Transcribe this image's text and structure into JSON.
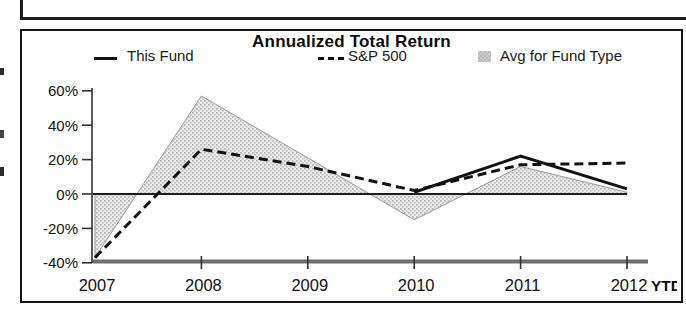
{
  "chart": {
    "title": "Annualized Total Return",
    "legend": {
      "this_fund_label": "This Fund",
      "sp500_label": "S&P 500",
      "avg_label": "Avg for Fund Type"
    }
  },
  "chart_data": {
    "type": "line",
    "title": "Annualized Total Return",
    "categories": [
      "2007",
      "2008",
      "2009",
      "2010",
      "2011",
      "2012"
    ],
    "x_axis_suffix": "YTD",
    "series": [
      {
        "name": "This Fund",
        "style": "solid-line",
        "values": [
          null,
          null,
          null,
          1,
          22,
          3
        ]
      },
      {
        "name": "S&P 500",
        "style": "dashed-line",
        "values": [
          -37,
          26,
          16,
          2,
          17,
          18
        ]
      },
      {
        "name": "Avg for Fund Type",
        "style": "shaded-area-to-zero",
        "values": [
          -37,
          57,
          21,
          -15,
          16,
          1
        ]
      }
    ],
    "yticks": [
      60,
      40,
      20,
      0,
      -20,
      -40
    ],
    "ytick_labels": [
      "60%",
      "40%",
      "20%",
      "0%",
      "-20%",
      "-40%"
    ],
    "ylim": [
      -45,
      65
    ],
    "xlabel": "",
    "ylabel": "",
    "grid": false,
    "legend_position": "top",
    "zero_line": true,
    "colors": {
      "line": "#111111",
      "area_fill": "#d9d9d9",
      "area_edge": "#9c9c9c",
      "axis": "#333333",
      "baseline": "#6e6e6e"
    }
  }
}
